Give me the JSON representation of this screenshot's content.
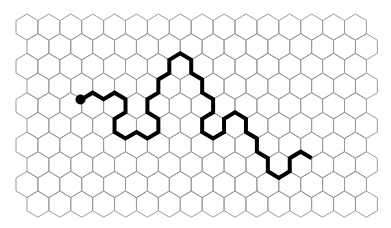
{
  "grid": {
    "type": "hexagonal",
    "orientation": "pointy-top",
    "rows": 10,
    "cols": 16,
    "origin_x": 16,
    "origin_y": 14,
    "hex_width": 21.9,
    "hex_height": 26.2,
    "row_spacing": 19.67,
    "odd_row_offset": 10.95,
    "line_color": "#9a9a9a",
    "background": "#ffffff"
  },
  "path": {
    "color": "#000000",
    "stroke_width": 4,
    "start_marker": {
      "x": 80.5,
      "y": 99.5,
      "r": 5
    },
    "points": [
      [
        81.7,
        99.2
      ],
      [
        92.65,
        92.7
      ],
      [
        103.6,
        99.2
      ],
      [
        114.55,
        92.7
      ],
      [
        125.5,
        99.2
      ],
      [
        125.5,
        112.3
      ],
      [
        114.55,
        118.9
      ],
      [
        114.55,
        132.0
      ],
      [
        125.5,
        138.5
      ],
      [
        136.45,
        132.0
      ],
      [
        147.4,
        138.5
      ],
      [
        158.35,
        132.0
      ],
      [
        158.35,
        118.9
      ],
      [
        147.4,
        112.3
      ],
      [
        147.4,
        99.2
      ],
      [
        158.35,
        92.7
      ],
      [
        158.35,
        79.5
      ],
      [
        169.3,
        73.0
      ],
      [
        169.3,
        59.9
      ],
      [
        180.25,
        53.3
      ],
      [
        191.2,
        59.9
      ],
      [
        191.2,
        73.0
      ],
      [
        202.15,
        79.5
      ],
      [
        202.15,
        92.7
      ],
      [
        213.1,
        99.2
      ],
      [
        213.1,
        112.3
      ],
      [
        202.15,
        118.9
      ],
      [
        202.15,
        132.0
      ],
      [
        213.1,
        138.5
      ],
      [
        224.05,
        132.0
      ],
      [
        224.05,
        118.9
      ],
      [
        235.0,
        112.3
      ],
      [
        245.95,
        118.9
      ],
      [
        245.95,
        132.0
      ],
      [
        256.9,
        138.5
      ],
      [
        256.9,
        151.7
      ],
      [
        267.85,
        158.2
      ],
      [
        267.85,
        171.3
      ],
      [
        278.8,
        177.9
      ],
      [
        289.75,
        171.3
      ],
      [
        289.75,
        158.2
      ],
      [
        300.7,
        151.7
      ],
      [
        311.65,
        158.2
      ]
    ]
  }
}
